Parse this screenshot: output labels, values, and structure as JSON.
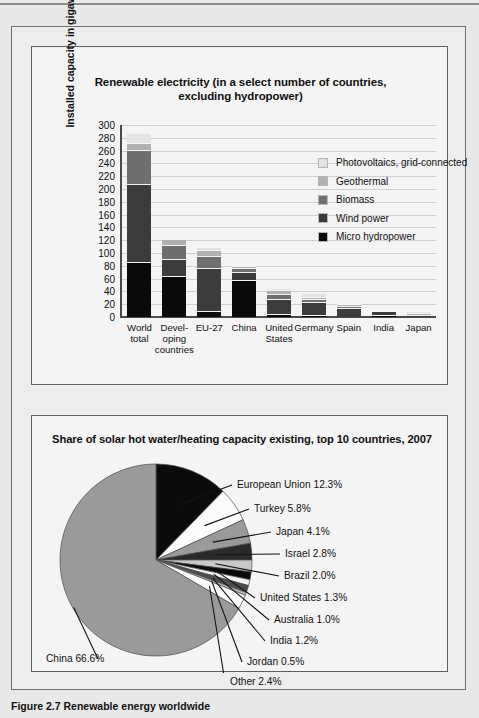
{
  "figure": {
    "caption": "Figure 2.7 Renewable energy worldwide"
  },
  "bar_panel": {
    "title_line1": "Renewable electricity (in a select number of countries,",
    "title_line2": "excluding hydropower)"
  },
  "pie_panel": {
    "title": "Share of solar hot water/heating capacity existing, top 10 countries, 2007"
  },
  "chart_data": [
    {
      "type": "bar",
      "subtype": "stacked",
      "title": "Renewable electricity (in a select number of countries, excluding hydropower)",
      "xlabel": "",
      "ylabel": "Installed capacity in gigawatts",
      "ylim": [
        0,
        300
      ],
      "yticks": [
        0,
        20,
        40,
        60,
        80,
        100,
        120,
        140,
        160,
        180,
        200,
        220,
        240,
        260,
        280,
        300
      ],
      "grid": true,
      "legend_position": "inside-top-right",
      "categories": [
        "World total",
        "Developing countries",
        "EU-27",
        "China",
        "United States",
        "Germany",
        "Spain",
        "India",
        "Japan"
      ],
      "category_lines": [
        [
          "World",
          "total"
        ],
        [
          "Devel-",
          "oping",
          "countries"
        ],
        [
          "EU-27"
        ],
        [
          "China"
        ],
        [
          "United",
          "States"
        ],
        [
          "Germany"
        ],
        [
          "Spain"
        ],
        [
          "India"
        ],
        [
          "Japan"
        ]
      ],
      "series": [
        {
          "name": "Micro hydropower",
          "color": "#0a0a0a",
          "values": [
            85,
            62,
            8,
            57,
            3,
            2,
            0,
            2,
            0
          ]
        },
        {
          "name": "Wind power",
          "color": "#3c3c3c",
          "values": [
            119,
            25,
            66,
            10,
            22,
            18,
            13,
            4,
            2
          ]
        },
        {
          "name": "Biomass",
          "color": "#6f6f6f",
          "values": [
            52,
            21,
            16,
            5,
            6,
            3,
            1,
            0,
            0
          ]
        },
        {
          "name": "Geothermal",
          "color": "#b0b0b0",
          "values": [
            10,
            7,
            8,
            1,
            5,
            2,
            1,
            0,
            1
          ]
        },
        {
          "name": "Photovoltaics, grid-connected",
          "color": "#e3e3e3",
          "values": [
            13,
            0,
            4,
            0,
            1,
            5,
            0,
            0,
            2
          ]
        }
      ],
      "legend": [
        {
          "label": "Photovoltaics, grid-connected",
          "color": "#e3e3e3"
        },
        {
          "label": "Geothermal",
          "color": "#b0b0b0"
        },
        {
          "label": "Biomass",
          "color": "#6f6f6f"
        },
        {
          "label": "Wind power",
          "color": "#3c3c3c"
        },
        {
          "label": "Micro hydropower",
          "color": "#0a0a0a"
        }
      ]
    },
    {
      "type": "pie",
      "title": "Share of solar hot water/heating capacity existing, top 10 countries, 2007",
      "unit": "%",
      "start_angle_deg": 0,
      "labels": [
        "European Union 12.3%",
        "Turkey 5.8%",
        "Japan 4.1%",
        "Israel 2.8%",
        "Brazil 2.0%",
        "United States 1.3%",
        "Australia 1.0%",
        "India 1.2%",
        "Jordan 0.5%",
        "Other 2.4%",
        "China 66.6%"
      ],
      "slices": [
        {
          "name": "European Union",
          "value": 12.3,
          "label": "European Union 12.3%",
          "color": "#0b0b0b"
        },
        {
          "name": "Turkey",
          "value": 5.8,
          "label": "Turkey 5.8%",
          "color": "#fbfbfb"
        },
        {
          "name": "Japan",
          "value": 4.1,
          "label": "Japan 4.1%",
          "color": "#9a9a9a"
        },
        {
          "name": "Israel",
          "value": 2.8,
          "label": "Israel 2.8%",
          "color": "#2a2a2a"
        },
        {
          "name": "Brazil",
          "value": 2.0,
          "label": "Brazil 2.0%",
          "color": "#c9c9c9"
        },
        {
          "name": "United States",
          "value": 1.3,
          "label": "United States 1.3%",
          "color": "#0b0b0b"
        },
        {
          "name": "Australia",
          "value": 1.0,
          "label": "Australia 1.0%",
          "color": "#f2f2f2"
        },
        {
          "name": "India",
          "value": 1.2,
          "label": "India 1.2%",
          "color": "#4d4d4d"
        },
        {
          "name": "Jordan",
          "value": 0.5,
          "label": "Jordan 0.5%",
          "color": "#b5b5b5"
        },
        {
          "name": "Other",
          "value": 2.4,
          "label": "Other 2.4%",
          "color": "#fbfbfb"
        },
        {
          "name": "China",
          "value": 66.6,
          "label": "China 66.6%",
          "color": "#9a9a9a"
        }
      ]
    }
  ]
}
